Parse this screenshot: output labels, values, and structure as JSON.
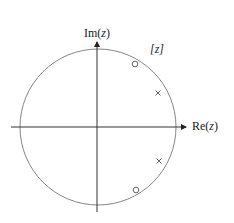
{
  "diagram": {
    "type": "pole-zero plot",
    "plane_label": "[z]",
    "axes": {
      "horizontal": {
        "label_prefix": "Re(",
        "label_var": "z",
        "label_suffix": ")"
      },
      "vertical": {
        "label_prefix": "Im(",
        "label_var": "z",
        "label_suffix": ")"
      }
    },
    "unit_circle": {
      "center": [
        98,
        127
      ],
      "radius": 78,
      "color": "#777777"
    },
    "axis_color": "#333333",
    "zeros": [
      {
        "x": 135,
        "y": 64
      },
      {
        "x": 136,
        "y": 190
      }
    ],
    "poles": [
      {
        "x": 158,
        "y": 93
      },
      {
        "x": 159,
        "y": 161
      }
    ]
  }
}
